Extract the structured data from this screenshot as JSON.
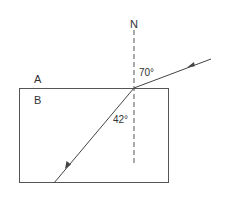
{
  "diagram": {
    "type": "refraction-ray-diagram",
    "normal_label": "N",
    "medium_top_label": "A",
    "medium_bottom_label": "B",
    "incident_angle_label": "70°",
    "refraction_angle_label": "42°",
    "colors": {
      "line": "#444444",
      "text": "#333333",
      "background": "#ffffff"
    }
  }
}
